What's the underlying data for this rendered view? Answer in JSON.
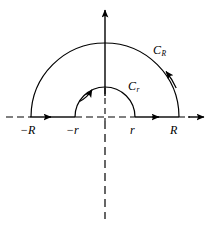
{
  "figure": {
    "background_color": "#ffffff",
    "stroke_color": "#000000",
    "axis_labels": [
      {
        "id": "neg-R",
        "text": "−R"
      },
      {
        "id": "neg-r",
        "text": "−r"
      },
      {
        "id": "pos-r",
        "text": "r"
      },
      {
        "id": "pos-R",
        "text": "R"
      }
    ],
    "curve_labels": [
      {
        "id": "CR",
        "base": "C",
        "subscript": "R"
      },
      {
        "id": "Cr",
        "base": "C",
        "subscript": "r"
      }
    ]
  }
}
